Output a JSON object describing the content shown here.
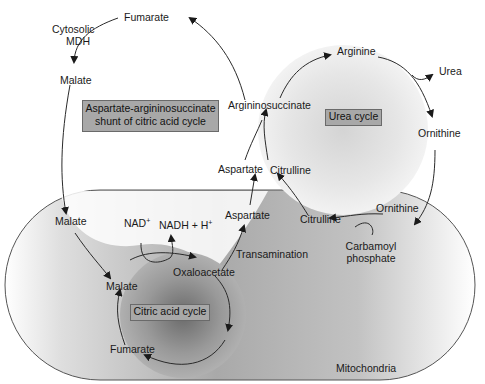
{
  "diagram": {
    "title_box": {
      "line1": "Aspartate-argininosuccinate",
      "line2": "shunt of citric acid cycle"
    },
    "compartment_label": "Mitochondria",
    "urea_cycle": {
      "label": "Urea cycle",
      "nodes": {
        "arginine": "Arginine",
        "urea": "Urea",
        "ornithine_cyto": "Ornithine",
        "ornithine_mito": "Ornithine",
        "citrulline_mito": "Citrulline",
        "citrulline_cyto": "Citrulline",
        "argininosuccinate": "Argininosuccinate",
        "aspartate_cyto": "Aspartate",
        "carbamoyl_line1": "Carbamoyl",
        "carbamoyl_line2": "phosphate"
      }
    },
    "citric_acid_cycle": {
      "label": "Citric acid cycle",
      "nodes": {
        "malate_mito_outer": "Malate",
        "malate_cycle": "Malate",
        "fumarate_cycle": "Fumarate",
        "oxaloacetate": "Oxaloacetate",
        "aspartate_mito": "Aspartate",
        "transamination": "Transamination",
        "nad": "NAD",
        "nad_sup": "+",
        "nadh": "NADH + H",
        "nadh_sup": "+"
      }
    },
    "cytosol": {
      "fumarate": "Fumarate",
      "cytosolic_mdh_line1": "Cytosolic",
      "cytosolic_mdh_line2": "MDH",
      "malate": "Malate"
    },
    "colors": {
      "line": "#2a2a2a",
      "box_fill": "#a8a8a8",
      "mito_shade_dark": "#8a8a8a",
      "cycle_center_dark": "#6e6e6e"
    }
  }
}
